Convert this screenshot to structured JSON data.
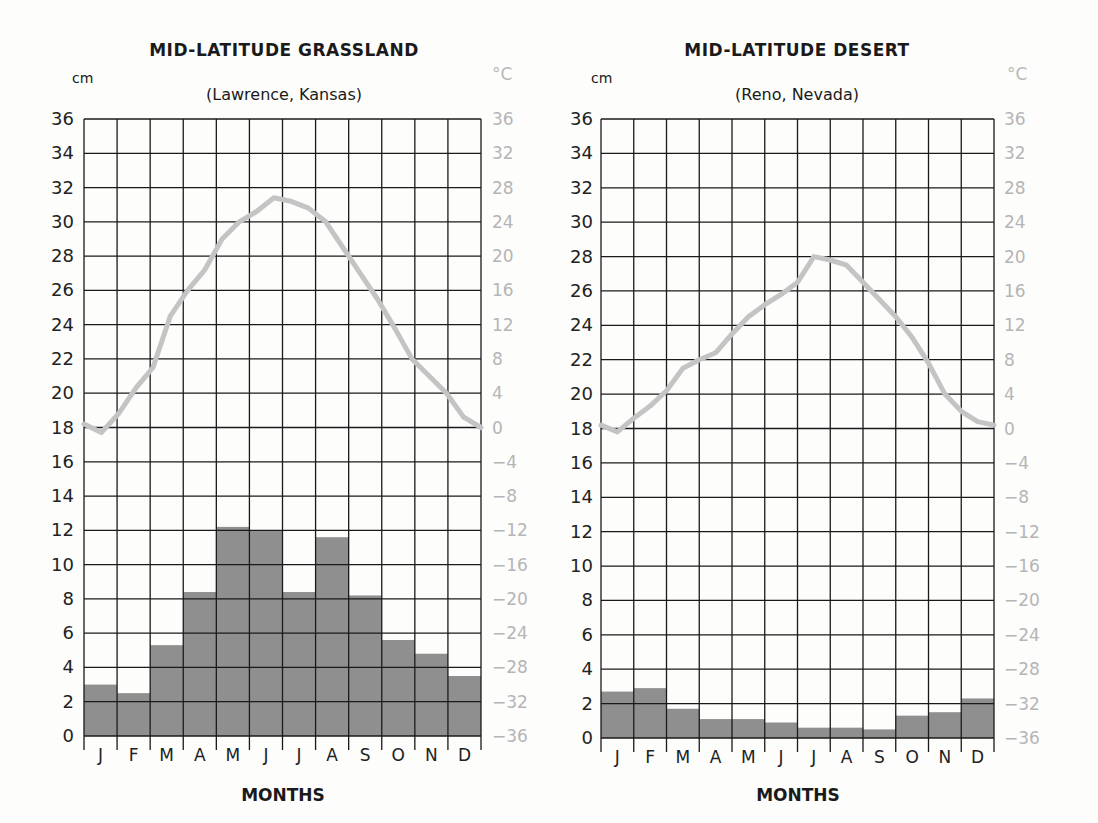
{
  "charts": [
    {
      "title": "MID-LATITUDE GRASSLAND",
      "subtitle": "(Lawrence, Kansas)",
      "left_unit": "cm",
      "right_unit": "°C",
      "xlabel": "MONTHS"
    },
    {
      "title": "MID-LATITUDE DESERT",
      "subtitle": "(Reno, Nevada)",
      "left_unit": "cm",
      "right_unit": "°C",
      "xlabel": "MONTHS"
    }
  ],
  "colors": {
    "bar_fill": "#8f8f8f",
    "temp_line": "#c4c4c4",
    "grid": "#1a1a1a",
    "right_axis_text": "#b5b5b5"
  },
  "chart_data": [
    {
      "type": "bar+line",
      "title": "MID-LATITUDE GRASSLAND",
      "subtitle": "(Lawrence, Kansas)",
      "xlabel": "MONTHS",
      "ylabel_left": "cm",
      "ylabel_right": "°C",
      "categories": [
        "J",
        "F",
        "M",
        "A",
        "M",
        "J",
        "J",
        "A",
        "S",
        "O",
        "N",
        "D"
      ],
      "ylim_left": [
        0,
        36
      ],
      "yticks_left": [
        0,
        2,
        4,
        6,
        8,
        10,
        12,
        14,
        16,
        18,
        20,
        22,
        24,
        26,
        28,
        30,
        32,
        34,
        36
      ],
      "ylim_right": [
        -36,
        36
      ],
      "yticks_right": [
        36,
        32,
        28,
        24,
        20,
        16,
        12,
        8,
        4,
        0,
        -4,
        -8,
        -12,
        -16,
        -20,
        -24,
        -28,
        -32,
        -36
      ],
      "grid": true,
      "series": [
        {
          "name": "Precipitation (cm)",
          "type": "bar",
          "values": [
            3.0,
            2.5,
            5.3,
            8.4,
            12.2,
            12.0,
            8.4,
            11.6,
            8.2,
            5.6,
            4.8,
            3.5
          ]
        },
        {
          "name": "Temperature (°C)",
          "type": "line",
          "values": [
            -0.6,
            2.0,
            7.0,
            13.0,
            18.0,
            24.0,
            26.6,
            25.5,
            20.0,
            13.5,
            6.0,
            1.0
          ]
        }
      ],
      "line_trace_cm": [
        18.2,
        17.7,
        18.8,
        20.3,
        21.5,
        24.5,
        26.0,
        27.2,
        29.0,
        30.0,
        30.6,
        31.4,
        31.2,
        30.8,
        30.0,
        28.5,
        27.0,
        25.5,
        23.8,
        22.0,
        21.0,
        20.0,
        18.6,
        18.0
      ]
    },
    {
      "type": "bar+line",
      "title": "MID-LATITUDE DESERT",
      "subtitle": "(Reno, Nevada)",
      "xlabel": "MONTHS",
      "ylabel_left": "cm",
      "ylabel_right": "°C",
      "categories": [
        "J",
        "F",
        "M",
        "A",
        "M",
        "J",
        "J",
        "A",
        "S",
        "O",
        "N",
        "D"
      ],
      "ylim_left": [
        0,
        36
      ],
      "yticks_left": [
        0,
        2,
        4,
        6,
        8,
        10,
        12,
        14,
        16,
        18,
        20,
        22,
        24,
        26,
        28,
        30,
        32,
        34,
        36
      ],
      "ylim_right": [
        -36,
        36
      ],
      "yticks_right": [
        36,
        32,
        28,
        24,
        20,
        16,
        12,
        8,
        4,
        0,
        -4,
        -8,
        -12,
        -16,
        -20,
        -24,
        -28,
        -32,
        -36
      ],
      "grid": true,
      "series": [
        {
          "name": "Precipitation (cm)",
          "type": "bar",
          "values": [
            2.7,
            2.9,
            1.7,
            1.1,
            1.1,
            0.9,
            0.6,
            0.6,
            0.5,
            1.3,
            1.5,
            2.3
          ]
        },
        {
          "name": "Temperature (°C)",
          "type": "line",
          "values": [
            -0.6,
            3.0,
            8.0,
            13.0,
            16.0,
            19.6,
            19.4,
            15.0,
            10.0,
            4.6,
            1.5,
            0.3
          ]
        }
      ],
      "line_trace_cm": [
        18.2,
        17.8,
        18.6,
        19.3,
        20.2,
        21.5,
        22.0,
        22.4,
        23.5,
        24.5,
        25.2,
        25.8,
        26.5,
        28.0,
        27.8,
        27.5,
        26.5,
        25.5,
        24.5,
        23.3,
        21.8,
        20.0,
        19.0,
        18.4,
        18.2
      ]
    }
  ]
}
